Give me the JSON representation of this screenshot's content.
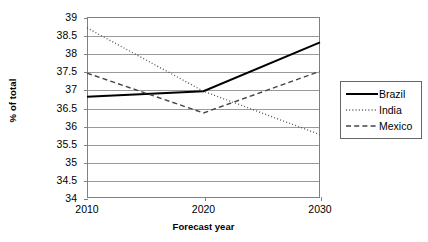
{
  "chart_data": {
    "type": "line",
    "title": "",
    "xlabel": "Forecast year",
    "ylabel": "% of total",
    "x": [
      2010,
      2020,
      2030
    ],
    "xtick_labels": [
      "2010",
      "2020",
      "2030"
    ],
    "ylim": [
      34,
      39
    ],
    "ytick_labels": [
      "39",
      "38.5",
      "38",
      "37.5",
      "37",
      "36.5",
      "36",
      "35.5",
      "35",
      "34.5",
      "34"
    ],
    "ytick_values": [
      39,
      38.5,
      38,
      37.5,
      37,
      36.5,
      36,
      35.5,
      35,
      34.5,
      34
    ],
    "grid": true,
    "legend_position": "right",
    "series": [
      {
        "name": "Brazil",
        "style": "solid",
        "color": "#000000",
        "values": [
          36.8,
          36.95,
          38.3
        ]
      },
      {
        "name": "India",
        "style": "dotted",
        "color": "#555555",
        "values": [
          38.7,
          36.95,
          35.75
        ]
      },
      {
        "name": "Mexico",
        "style": "dashed",
        "color": "#444444",
        "values": [
          37.45,
          36.35,
          37.5
        ]
      }
    ]
  },
  "axes": {
    "y_label": "% of total",
    "x_label": "Forecast year"
  },
  "legend": {
    "items": [
      {
        "label": "Brazil"
      },
      {
        "label": "India"
      },
      {
        "label": "Mexico"
      }
    ]
  }
}
